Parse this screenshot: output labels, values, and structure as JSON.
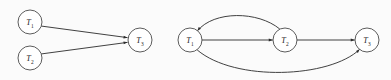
{
  "figure": {
    "background_color": "#fbfbfb",
    "node_fill": "#ffffff",
    "node_stroke": "#4a4a4a",
    "edge_color": "#2b2b2b",
    "width": 391,
    "height": 80
  },
  "panels": [
    {
      "id": "left-panel",
      "name": "fork-join-graph",
      "nodes": [
        {
          "id": "L-T1",
          "label_base": "T",
          "label_sub": "1",
          "cx": 30,
          "cy": 22,
          "r": 12
        },
        {
          "id": "L-T2",
          "label_base": "T",
          "label_sub": "2",
          "cx": 30,
          "cy": 58,
          "r": 12
        },
        {
          "id": "L-T3",
          "label_base": "T",
          "label_sub": "3",
          "cx": 140,
          "cy": 40,
          "r": 12
        }
      ],
      "edges": [
        {
          "id": "L-e1",
          "from": "T1",
          "to": "T3",
          "kind": "straight",
          "path": "M 41.6 26.1 L 127.2 37.6"
        },
        {
          "id": "L-e2",
          "from": "T2",
          "to": "T3",
          "kind": "straight",
          "path": "M 41.6 53.9 L 127.2 42.4"
        }
      ]
    },
    {
      "id": "right-panel",
      "name": "cyclic-dependency-graph",
      "nodes": [
        {
          "id": "R-T1",
          "label_base": "T",
          "label_sub": "1",
          "cx": 190,
          "cy": 40,
          "r": 12
        },
        {
          "id": "R-T2",
          "label_base": "T",
          "label_sub": "2",
          "cx": 285,
          "cy": 40,
          "r": 12
        },
        {
          "id": "R-T3",
          "label_base": "T",
          "label_sub": "3",
          "cx": 367,
          "cy": 40,
          "r": 12
        }
      ],
      "edges": [
        {
          "id": "R-e1",
          "from": "T1",
          "to": "T2",
          "kind": "straight",
          "path": "M 202 40 L 272.4 40"
        },
        {
          "id": "R-e2",
          "from": "T2",
          "to": "T3",
          "kind": "straight",
          "path": "M 297 40 L 354.4 40"
        },
        {
          "id": "R-e3",
          "from": "T2",
          "to": "T1",
          "kind": "arc-above",
          "path": "M 279.5 28.8 C 258 11 214 10.5 197.6 30.6"
        },
        {
          "id": "R-e4",
          "from": "T1",
          "to": "T3",
          "kind": "arc-below",
          "path": "M 197.5 50.2 C 235 82 330 78 359.5 49.5"
        }
      ]
    }
  ],
  "arrowhead": {
    "name": "filled-triangle",
    "width": 5.2,
    "height": 3.6
  }
}
